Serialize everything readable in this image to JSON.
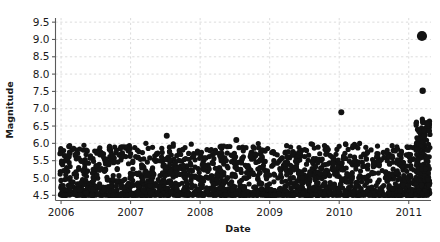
{
  "chart_data": {
    "type": "scatter",
    "title": "",
    "xlabel": "Date",
    "ylabel": "Magnitude",
    "xlim": [
      2005.92,
      2011.32
    ],
    "ylim": [
      4.35,
      9.62
    ],
    "grid": true,
    "legend": null,
    "xtick_labels": [
      "2006",
      "2007",
      "2008",
      "2009",
      "2010",
      "2011"
    ],
    "xtick_values": [
      2006,
      2007,
      2008,
      2009,
      2010,
      2011
    ],
    "ytick_labels": [
      "4.5",
      "5.0",
      "5.5",
      "6.0",
      "6.5",
      "7.0",
      "7.5",
      "8.0",
      "8.5",
      "9.0",
      "9.5"
    ],
    "ytick_values": [
      4.5,
      5.0,
      5.5,
      6.0,
      6.5,
      7.0,
      7.5,
      8.0,
      8.5,
      9.0,
      9.5
    ],
    "marker_color": "#121212",
    "grid_color": "#d8d8d8",
    "marker_size": 5.2,
    "annotations": [
      {
        "label": "largest event",
        "x": 2011.19,
        "y": 9.1,
        "marker_size": 10.2
      },
      {
        "label": "second largest event",
        "x": 2011.2,
        "y": 7.52,
        "marker_size": 6.4
      }
    ],
    "series": [
      {
        "name": "earthquakes",
        "points": [
          [
            2011.19,
            9.1,
            10.2
          ],
          [
            2011.2,
            7.52,
            6.4
          ],
          [
            2010.03,
            6.9,
            6.0
          ],
          [
            2007.52,
            6.22,
            6.0
          ],
          [
            2008.52,
            6.1,
            6.0
          ],
          [
            2006.08,
            5.3,
            5.2
          ],
          [
            2006.14,
            4.9,
            5.2
          ],
          [
            2006.17,
            4.75,
            5.2
          ],
          [
            2006.2,
            4.62,
            5.2
          ],
          [
            2006.23,
            4.56,
            5.2
          ],
          [
            2006.26,
            4.55,
            5.2
          ],
          [
            2006.29,
            4.7,
            5.2
          ],
          [
            2006.31,
            4.95,
            5.2
          ],
          [
            2006.34,
            5.3,
            5.2
          ],
          [
            2006.36,
            5.68,
            5.2
          ],
          [
            2006.39,
            4.58,
            5.2
          ],
          [
            2006.42,
            4.52,
            5.2
          ],
          [
            2006.44,
            4.62,
            5.2
          ],
          [
            2006.47,
            4.98,
            5.2
          ],
          [
            2006.5,
            5.3,
            5.2
          ],
          [
            2006.52,
            5.78,
            5.2
          ],
          [
            2006.55,
            5.8,
            5.2
          ],
          [
            2006.58,
            4.6,
            5.2
          ],
          [
            2006.61,
            4.55,
            5.2
          ],
          [
            2006.63,
            4.72,
            5.2
          ],
          [
            2006.66,
            5.02,
            5.2
          ],
          [
            2006.69,
            5.4,
            5.2
          ],
          [
            2006.71,
            5.82,
            5.2
          ],
          [
            2006.74,
            4.58,
            5.2
          ],
          [
            2006.77,
            4.54,
            5.2
          ],
          [
            2006.8,
            4.62,
            5.2
          ],
          [
            2006.83,
            4.92,
            5.2
          ],
          [
            2006.86,
            5.52,
            5.2
          ],
          [
            2006.88,
            5.9,
            5.2
          ],
          [
            2006.91,
            4.6,
            5.2
          ],
          [
            2006.94,
            4.55,
            5.2
          ],
          [
            2006.97,
            4.7,
            5.2
          ],
          [
            2007.0,
            5.1,
            5.2
          ],
          [
            2007.03,
            5.45,
            5.2
          ],
          [
            2007.06,
            5.88,
            5.2
          ],
          [
            2007.08,
            4.58,
            5.2
          ],
          [
            2007.11,
            4.54,
            5.2
          ],
          [
            2007.14,
            4.66,
            5.2
          ],
          [
            2007.17,
            5.05,
            5.2
          ],
          [
            2007.19,
            5.55,
            5.2
          ],
          [
            2007.22,
            6.0,
            5.2
          ],
          [
            2007.25,
            4.6,
            5.2
          ],
          [
            2007.28,
            4.55,
            5.2
          ],
          [
            2007.31,
            4.74,
            5.2
          ],
          [
            2007.33,
            5.12,
            5.2
          ],
          [
            2007.36,
            5.48,
            5.2
          ],
          [
            2007.39,
            5.72,
            5.2
          ],
          [
            2007.42,
            4.6,
            5.2
          ],
          [
            2007.44,
            4.56,
            5.2
          ],
          [
            2007.47,
            4.78,
            5.2
          ],
          [
            2007.5,
            5.18,
            5.2
          ],
          [
            2007.53,
            5.58,
            5.2
          ],
          [
            2007.56,
            5.76,
            5.2
          ],
          [
            2007.58,
            4.62,
            5.2
          ],
          [
            2007.61,
            4.55,
            5.2
          ],
          [
            2007.64,
            4.8,
            5.2
          ],
          [
            2007.67,
            5.22,
            5.2
          ],
          [
            2007.69,
            5.5,
            5.2
          ],
          [
            2007.72,
            5.68,
            5.2
          ],
          [
            2007.75,
            4.6,
            5.2
          ],
          [
            2007.78,
            4.55,
            5.2
          ],
          [
            2007.81,
            4.74,
            5.2
          ],
          [
            2007.83,
            5.08,
            5.2
          ],
          [
            2007.86,
            5.42,
            5.2
          ],
          [
            2007.89,
            5.6,
            5.2
          ],
          [
            2007.92,
            4.58,
            5.2
          ],
          [
            2007.94,
            4.54,
            5.2
          ],
          [
            2007.97,
            4.68,
            5.2
          ],
          [
            2008.0,
            5.02,
            5.2
          ],
          [
            2008.03,
            5.38,
            5.2
          ],
          [
            2008.06,
            5.58,
            5.2
          ],
          [
            2008.08,
            4.6,
            5.2
          ],
          [
            2008.11,
            4.55,
            5.2
          ],
          [
            2008.14,
            4.7,
            5.2
          ],
          [
            2008.17,
            5.06,
            5.2
          ],
          [
            2008.19,
            5.42,
            5.2
          ],
          [
            2008.22,
            5.8,
            5.2
          ],
          [
            2008.25,
            4.6,
            5.2
          ],
          [
            2008.28,
            4.56,
            5.2
          ],
          [
            2008.31,
            4.76,
            5.2
          ],
          [
            2008.33,
            5.12,
            5.2
          ],
          [
            2008.36,
            5.5,
            5.2
          ],
          [
            2008.39,
            5.72,
            5.2
          ],
          [
            2008.42,
            4.58,
            5.2
          ],
          [
            2008.44,
            4.54,
            5.2
          ],
          [
            2008.47,
            4.72,
            5.2
          ],
          [
            2008.5,
            5.1,
            5.2
          ],
          [
            2008.56,
            5.46,
            5.2
          ],
          [
            2008.58,
            4.6,
            5.2
          ],
          [
            2008.61,
            4.55,
            5.2
          ],
          [
            2008.64,
            4.68,
            5.2
          ],
          [
            2008.67,
            5.0,
            5.2
          ],
          [
            2008.69,
            5.36,
            5.2
          ],
          [
            2008.72,
            5.62,
            5.2
          ],
          [
            2008.75,
            4.58,
            5.2
          ],
          [
            2008.78,
            4.54,
            5.2
          ],
          [
            2008.81,
            4.66,
            5.2
          ],
          [
            2008.83,
            4.98,
            5.2
          ],
          [
            2008.86,
            5.3,
            5.2
          ],
          [
            2008.89,
            5.56,
            5.2
          ],
          [
            2008.92,
            4.6,
            5.2
          ],
          [
            2008.94,
            4.55,
            5.2
          ],
          [
            2008.97,
            4.72,
            5.2
          ],
          [
            2009.0,
            5.08,
            5.2
          ],
          [
            2009.03,
            5.34,
            5.2
          ],
          [
            2009.06,
            5.5,
            5.2
          ],
          [
            2009.08,
            4.58,
            5.2
          ],
          [
            2009.11,
            4.54,
            5.2
          ],
          [
            2009.14,
            4.68,
            5.2
          ],
          [
            2009.17,
            5.02,
            5.2
          ],
          [
            2009.19,
            5.28,
            5.2
          ],
          [
            2009.22,
            5.44,
            5.2
          ],
          [
            2009.25,
            4.6,
            5.2
          ],
          [
            2009.28,
            4.55,
            5.2
          ],
          [
            2009.31,
            4.7,
            5.2
          ],
          [
            2009.33,
            5.0,
            5.2
          ],
          [
            2009.36,
            5.3,
            5.2
          ],
          [
            2009.39,
            5.52,
            5.2
          ],
          [
            2009.42,
            4.58,
            5.2
          ],
          [
            2009.44,
            4.54,
            5.2
          ],
          [
            2009.47,
            4.72,
            5.2
          ],
          [
            2009.5,
            5.08,
            5.2
          ],
          [
            2009.53,
            5.4,
            5.2
          ],
          [
            2009.56,
            5.66,
            5.2
          ],
          [
            2009.58,
            4.6,
            5.2
          ],
          [
            2009.61,
            4.55,
            5.2
          ],
          [
            2009.64,
            4.74,
            5.2
          ],
          [
            2009.67,
            5.12,
            5.2
          ],
          [
            2009.69,
            5.48,
            5.2
          ],
          [
            2009.72,
            5.7,
            5.2
          ],
          [
            2009.75,
            4.6,
            5.2
          ],
          [
            2009.78,
            4.56,
            5.2
          ],
          [
            2009.81,
            4.76,
            5.2
          ],
          [
            2009.83,
            5.16,
            5.2
          ],
          [
            2009.86,
            5.44,
            5.2
          ],
          [
            2009.89,
            5.62,
            5.2
          ],
          [
            2009.92,
            4.58,
            5.2
          ],
          [
            2009.94,
            4.54,
            5.2
          ],
          [
            2009.97,
            4.7,
            5.2
          ],
          [
            2010.0,
            5.04,
            5.2
          ],
          [
            2010.06,
            5.56,
            5.2
          ],
          [
            2010.08,
            4.6,
            5.2
          ],
          [
            2010.11,
            4.55,
            5.2
          ],
          [
            2010.14,
            4.72,
            5.2
          ],
          [
            2010.17,
            5.1,
            5.2
          ],
          [
            2010.19,
            5.38,
            5.2
          ],
          [
            2010.22,
            5.6,
            5.2
          ],
          [
            2010.25,
            4.58,
            5.2
          ],
          [
            2010.28,
            4.54,
            5.2
          ],
          [
            2010.31,
            4.68,
            5.2
          ],
          [
            2010.33,
            5.02,
            5.2
          ],
          [
            2010.36,
            5.34,
            5.2
          ],
          [
            2010.39,
            5.56,
            5.2
          ],
          [
            2010.42,
            4.6,
            5.2
          ],
          [
            2010.44,
            4.55,
            5.2
          ],
          [
            2010.47,
            4.74,
            5.2
          ],
          [
            2010.5,
            5.14,
            5.2
          ],
          [
            2010.53,
            5.46,
            5.2
          ],
          [
            2010.56,
            5.7,
            5.2
          ],
          [
            2010.58,
            4.62,
            5.2
          ],
          [
            2010.61,
            4.56,
            5.2
          ],
          [
            2010.64,
            4.78,
            5.2
          ],
          [
            2010.67,
            5.18,
            5.2
          ],
          [
            2010.69,
            5.5,
            5.2
          ],
          [
            2010.72,
            5.68,
            5.2
          ],
          [
            2010.75,
            4.6,
            5.2
          ],
          [
            2010.78,
            4.55,
            5.2
          ],
          [
            2010.81,
            4.72,
            5.2
          ],
          [
            2010.83,
            5.1,
            5.2
          ],
          [
            2010.86,
            5.4,
            5.2
          ],
          [
            2010.89,
            5.58,
            5.2
          ],
          [
            2010.92,
            4.58,
            5.2
          ],
          [
            2010.94,
            4.54,
            5.2
          ],
          [
            2010.97,
            4.7,
            5.2
          ],
          [
            2011.0,
            5.06,
            5.2
          ],
          [
            2011.03,
            5.36,
            5.2
          ],
          [
            2011.06,
            5.54,
            5.2
          ],
          [
            2011.08,
            4.6,
            5.2
          ],
          [
            2011.1,
            4.66,
            5.2
          ],
          [
            2011.12,
            4.9,
            5.2
          ],
          [
            2011.14,
            5.2,
            5.2
          ],
          [
            2011.16,
            5.7,
            5.2
          ],
          [
            2011.175,
            6.1,
            5.2
          ],
          [
            2011.185,
            6.45,
            5.2
          ],
          [
            2011.195,
            6.7,
            5.2
          ],
          [
            2011.2,
            6.3,
            5.2
          ],
          [
            2011.205,
            6.0,
            5.2
          ],
          [
            2011.21,
            5.8,
            5.2
          ],
          [
            2011.215,
            5.6,
            5.2
          ],
          [
            2011.22,
            5.4,
            5.2
          ],
          [
            2011.225,
            5.2,
            5.2
          ],
          [
            2011.23,
            5.0,
            5.2
          ],
          [
            2011.235,
            4.85,
            5.2
          ],
          [
            2011.24,
            4.7,
            5.2
          ],
          [
            2011.245,
            4.6,
            5.2
          ],
          [
            2011.25,
            4.55,
            5.2
          ],
          [
            2011.255,
            4.52,
            5.2
          ],
          [
            2011.26,
            4.58,
            5.2
          ],
          [
            2011.265,
            4.75,
            5.2
          ],
          [
            2011.27,
            4.95,
            5.2
          ],
          [
            2011.275,
            5.15,
            5.2
          ],
          [
            2011.28,
            5.35,
            5.2
          ],
          [
            2011.285,
            5.0,
            5.2
          ],
          [
            2011.29,
            4.8,
            5.2
          ],
          [
            2011.295,
            4.65,
            5.2
          ],
          [
            2011.3,
            4.55,
            5.2
          ]
        ]
      }
    ]
  }
}
